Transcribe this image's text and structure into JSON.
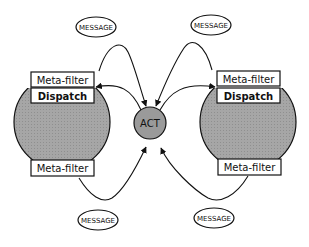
{
  "diagram": {
    "center_node": {
      "label": "ACT",
      "fill": "#9a9a9a"
    },
    "objects": [
      {
        "side": "left",
        "fill": "#a8a8a8",
        "top_filter": "Meta-filter",
        "dispatch": "Dispatch",
        "bottom_filter": "Meta-filter"
      },
      {
        "side": "right",
        "fill": "#a8a8a8",
        "top_filter": "Meta-filter",
        "dispatch": "Dispatch",
        "bottom_filter": "Meta-filter"
      }
    ],
    "messages": [
      {
        "position": "top-left",
        "label": "MESSAGE"
      },
      {
        "position": "top-right",
        "label": "MESSAGE"
      },
      {
        "position": "bottom-left",
        "label": "MESSAGE"
      },
      {
        "position": "bottom-right",
        "label": "MESSAGE"
      }
    ],
    "colors": {
      "stroke": "#111111",
      "object_fill": "#a8a8a8",
      "act_fill": "#9a9a9a",
      "background": "#ffffff"
    }
  }
}
